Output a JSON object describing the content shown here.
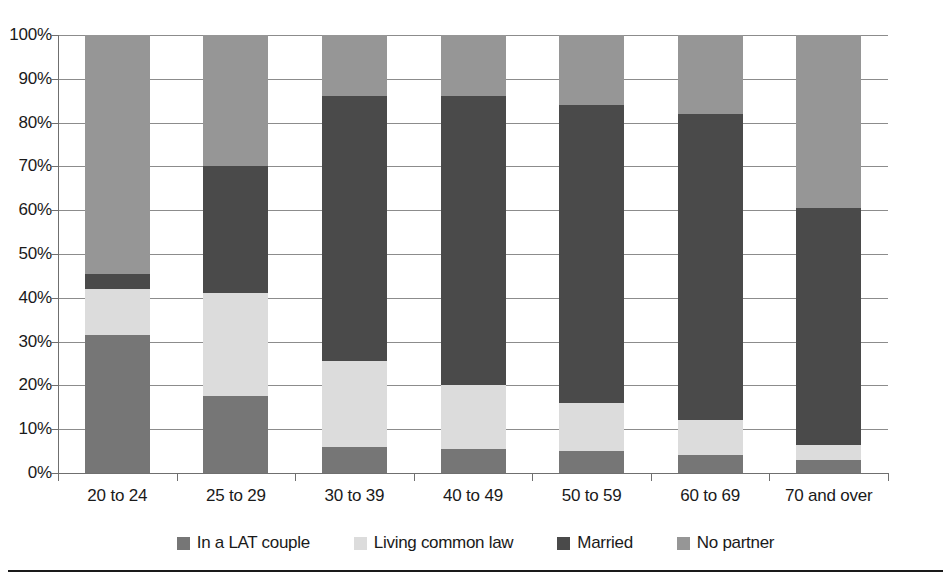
{
  "chart_data": {
    "type": "bar",
    "subtype": "stacked-100-percent",
    "title": "",
    "xlabel": "",
    "ylabel": "",
    "ylim": [
      0,
      100
    ],
    "grid": true,
    "legend_position": "bottom",
    "categories": [
      "20 to 24",
      "25 to 29",
      "30 to 39",
      "40 to 49",
      "50 to 59",
      "60 to 69",
      "70 and over"
    ],
    "ytick_labels": [
      "100%",
      "90%",
      "80%",
      "70%",
      "60%",
      "50%",
      "40%",
      "30%",
      "20%",
      "10%",
      "0%"
    ],
    "ytick_values": [
      100,
      90,
      80,
      70,
      60,
      50,
      40,
      30,
      20,
      10,
      0
    ],
    "stack_order_bottom_to_top": [
      "In a LAT couple",
      "Living common law",
      "Married",
      "No partner"
    ],
    "series": [
      {
        "name": "In a LAT couple",
        "color": "#767676",
        "values": [
          31.5,
          17.5,
          6.0,
          5.5,
          5.0,
          4.0,
          3.0
        ]
      },
      {
        "name": "Living common law",
        "color": "#dcdcdc",
        "values": [
          10.5,
          23.5,
          19.5,
          14.5,
          11.0,
          8.0,
          3.5
        ]
      },
      {
        "name": "Married",
        "color": "#4a4a4a",
        "values": [
          3.5,
          29.0,
          60.5,
          66.0,
          68.0,
          70.0,
          54.0
        ]
      },
      {
        "name": "No partner",
        "color": "#969696",
        "values": [
          54.5,
          30.0,
          14.0,
          14.0,
          16.0,
          18.0,
          39.5
        ]
      }
    ]
  },
  "legend": {
    "items": [
      {
        "label": "In a LAT couple",
        "color": "#767676"
      },
      {
        "label": "Living common law",
        "color": "#dcdcdc"
      },
      {
        "label": "Married",
        "color": "#4a4a4a"
      },
      {
        "label": "No partner",
        "color": "#969696"
      }
    ]
  },
  "footer": {
    "caption": ""
  }
}
